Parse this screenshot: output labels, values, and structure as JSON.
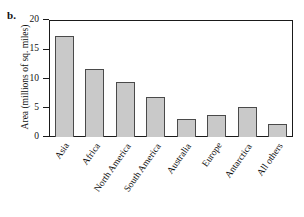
{
  "figure": {
    "panel_label": "b.",
    "background_color": "#ffffff",
    "bar_fill_color": "#c9c9c9",
    "bar_edge_color": "#4a4a4a",
    "axis_color": "#1a1a1a"
  },
  "chart_data": {
    "type": "bar",
    "title": "",
    "xlabel": "",
    "ylabel": "Area (millions of sq. miles)",
    "categories": [
      "Asia",
      "Africa",
      "North America",
      "South America",
      "Australia",
      "Europe",
      "Antarctica",
      "All others"
    ],
    "values": [
      17.2,
      11.6,
      9.4,
      6.9,
      3.0,
      3.8,
      5.1,
      2.2
    ],
    "ylim": [
      0,
      20
    ],
    "yticks": [
      0,
      5,
      10,
      15,
      20
    ],
    "ytick_labels": [
      "0",
      "5",
      "10",
      "15",
      "20"
    ],
    "grid": false,
    "legend": false,
    "legend_position": "none"
  }
}
